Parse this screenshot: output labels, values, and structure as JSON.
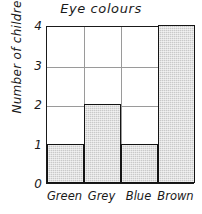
{
  "chart_data": {
    "type": "bar",
    "title": "Eye colours",
    "xlabel": "",
    "ylabel": "Number of children",
    "categories": [
      "Green",
      "Grey",
      "Blue",
      "Brown"
    ],
    "values": [
      1,
      2,
      1,
      4
    ],
    "yticks": [
      "0",
      "1",
      "2",
      "3",
      "4"
    ],
    "ylim": [
      0,
      4
    ],
    "grid": true,
    "legend": false,
    "bar_fill_color": "#c9c9c9",
    "bar_outline_color": "#141414",
    "grid_color": "#9a9a9a",
    "axis_color": "#1a1a1a",
    "background_color": "#ffffff"
  }
}
